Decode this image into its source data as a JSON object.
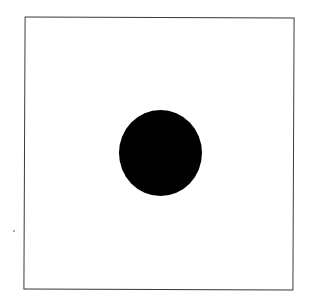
{
  "figure": {
    "frame": {
      "shape": "square",
      "stroke_color": "#3a3a3a",
      "fill": "#ffffff"
    },
    "center_mark": {
      "shape": "circle",
      "fill": "#000000"
    }
  }
}
